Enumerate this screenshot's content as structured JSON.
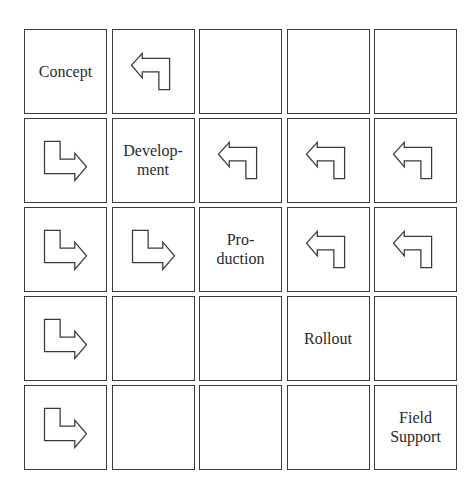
{
  "diagram": {
    "title": "",
    "grid": {
      "rows": 5,
      "cols": 5
    },
    "cells": [
      [
        {
          "type": "label",
          "text": "Concept"
        },
        {
          "type": "arrow",
          "icon": "arrow-back-left-icon",
          "direction": "back"
        },
        {
          "type": "empty"
        },
        {
          "type": "empty"
        },
        {
          "type": "empty"
        }
      ],
      [
        {
          "type": "arrow",
          "icon": "arrow-forward-right-icon",
          "direction": "forward"
        },
        {
          "type": "label",
          "text": "Develop-\nment"
        },
        {
          "type": "arrow",
          "icon": "arrow-back-left-icon",
          "direction": "back"
        },
        {
          "type": "arrow",
          "icon": "arrow-back-left-icon",
          "direction": "back"
        },
        {
          "type": "arrow",
          "icon": "arrow-back-left-icon",
          "direction": "back"
        }
      ],
      [
        {
          "type": "arrow",
          "icon": "arrow-forward-right-icon",
          "direction": "forward"
        },
        {
          "type": "arrow",
          "icon": "arrow-forward-right-icon",
          "direction": "forward"
        },
        {
          "type": "label",
          "text": "Pro-\nduction"
        },
        {
          "type": "arrow",
          "icon": "arrow-back-left-icon",
          "direction": "back"
        },
        {
          "type": "arrow",
          "icon": "arrow-back-left-icon",
          "direction": "back"
        }
      ],
      [
        {
          "type": "arrow",
          "icon": "arrow-forward-right-icon",
          "direction": "forward"
        },
        {
          "type": "empty"
        },
        {
          "type": "empty"
        },
        {
          "type": "label",
          "text": "Rollout"
        },
        {
          "type": "empty"
        }
      ],
      [
        {
          "type": "arrow",
          "icon": "arrow-forward-right-icon",
          "direction": "forward"
        },
        {
          "type": "empty"
        },
        {
          "type": "empty"
        },
        {
          "type": "empty"
        },
        {
          "type": "label",
          "text": "Field\nSupport"
        }
      ]
    ],
    "phases": [
      "Concept",
      "Develop-\nment",
      "Pro-\nduction",
      "Rollout",
      "Field\nSupport"
    ],
    "colors": {
      "border": "#3a3a3a",
      "text": "#2a2a2a",
      "background": "#ffffff"
    }
  }
}
